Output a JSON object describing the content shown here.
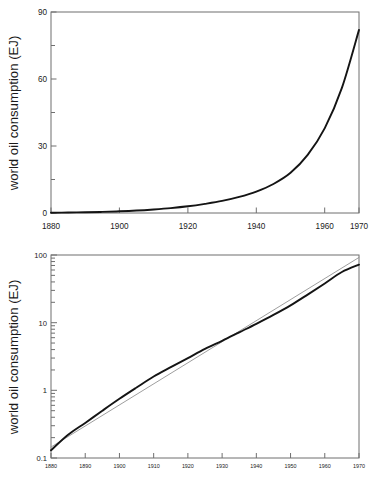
{
  "figure": {
    "background_color": "#ffffff",
    "axis_color": "#6f6f6f",
    "data_line_color": "#141414",
    "reference_line_color": "#8d8d8d"
  },
  "panels": {
    "linear": {
      "name": "world-oil-consumption-linear",
      "ylabel": "world oil consumption (EJ)",
      "xlabel": "",
      "y_ticks": [
        "0",
        "30",
        "60",
        "90"
      ],
      "y_minor_ticks": [
        "15",
        "45",
        "75"
      ],
      "x_ticks": [
        "1880",
        "1900",
        "1920",
        "1940",
        "1960",
        "1970"
      ]
    },
    "log": {
      "name": "world-oil-consumption-log",
      "ylabel": "world oil consumption (EJ)",
      "xlabel": "",
      "y_ticks": [
        "0.1",
        "1",
        "10",
        "100"
      ],
      "x_ticks": [
        "1880",
        "1890",
        "1900",
        "1910",
        "1920",
        "1930",
        "1940",
        "1950",
        "1960",
        "1970"
      ]
    }
  },
  "chart_data": [
    {
      "type": "line",
      "id": "linear-panel",
      "title": "",
      "xlabel": "",
      "ylabel": "world oil consumption (EJ)",
      "xlim": [
        1880,
        1970
      ],
      "ylim": [
        0,
        90
      ],
      "yscale": "linear",
      "xscale": "linear",
      "grid": false,
      "legend": "none",
      "xticks": [
        1880,
        1900,
        1920,
        1940,
        1960,
        1970
      ],
      "yticks": [
        0,
        30,
        60,
        90
      ],
      "yminorticks": [
        15,
        45,
        75
      ],
      "series": [
        {
          "name": "world oil consumption",
          "x": [
            1880,
            1885,
            1890,
            1895,
            1900,
            1905,
            1910,
            1915,
            1920,
            1925,
            1930,
            1935,
            1940,
            1945,
            1950,
            1955,
            1960,
            1965,
            1970
          ],
          "values": [
            0.13,
            0.22,
            0.33,
            0.5,
            0.75,
            1.1,
            1.6,
            2.2,
            3.0,
            4.1,
            5.4,
            7.2,
            9.6,
            13.0,
            18.0,
            26.0,
            38.0,
            56.0,
            82.0
          ]
        }
      ]
    },
    {
      "type": "line",
      "id": "log-panel",
      "title": "",
      "xlabel": "",
      "ylabel": "world oil consumption (EJ)",
      "xlim": [
        1880,
        1970
      ],
      "ylim": [
        0.1,
        100
      ],
      "yscale": "log",
      "xscale": "linear",
      "grid": false,
      "legend": "none",
      "xticks": [
        1880,
        1890,
        1900,
        1910,
        1920,
        1930,
        1940,
        1950,
        1960,
        1970
      ],
      "yticks": [
        0.1,
        1,
        10,
        100
      ],
      "series": [
        {
          "name": "world oil consumption",
          "x": [
            1880,
            1885,
            1890,
            1895,
            1900,
            1905,
            1910,
            1915,
            1920,
            1925,
            1930,
            1935,
            1940,
            1945,
            1950,
            1955,
            1960,
            1965,
            1970
          ],
          "values": [
            0.13,
            0.22,
            0.33,
            0.5,
            0.75,
            1.1,
            1.6,
            2.2,
            3.0,
            4.1,
            5.4,
            7.2,
            9.6,
            13.0,
            18.0,
            26.0,
            38.0,
            56.0,
            72.0
          ]
        },
        {
          "name": "exponential fit",
          "x": [
            1880,
            1970
          ],
          "values": [
            0.145,
            92.0
          ]
        }
      ]
    }
  ]
}
